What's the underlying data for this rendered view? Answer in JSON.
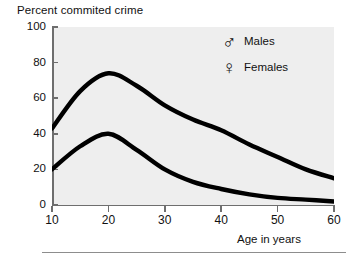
{
  "chart_data": {
    "type": "line",
    "title": "Percent commited crime",
    "xlabel": "Age in years",
    "ylabel": "Percent commited crime",
    "xlim": [
      10,
      60
    ],
    "ylim": [
      0,
      100
    ],
    "grid": false,
    "legend_position": "top-right",
    "x": [
      10,
      15,
      20,
      25,
      30,
      35,
      40,
      45,
      50,
      55,
      60
    ],
    "xticks": [
      "10",
      "20",
      "30",
      "40",
      "50",
      "60"
    ],
    "yticks": [
      "0",
      "20",
      "40",
      "60",
      "80",
      "100"
    ],
    "series": [
      {
        "name": "Males",
        "symbol": "♂",
        "color": "#000000",
        "values": [
          43,
          64,
          74,
          67,
          56,
          48,
          42,
          34,
          27,
          20,
          15
        ]
      },
      {
        "name": "Females",
        "symbol": "♀",
        "color": "#000000",
        "values": [
          20,
          33,
          40,
          31,
          20,
          13,
          9,
          6,
          4,
          3,
          2
        ]
      }
    ]
  },
  "legend": {
    "items": [
      {
        "symbol": "♂",
        "label": "Males"
      },
      {
        "symbol": "♀",
        "label": "Females"
      }
    ]
  },
  "colors": {
    "plot_background": "#eeeeee",
    "page_background": "#ffffff",
    "axis": "#6e6e6e",
    "curve": "#000000",
    "text": "#111111",
    "rule": "#8d8d8d"
  }
}
